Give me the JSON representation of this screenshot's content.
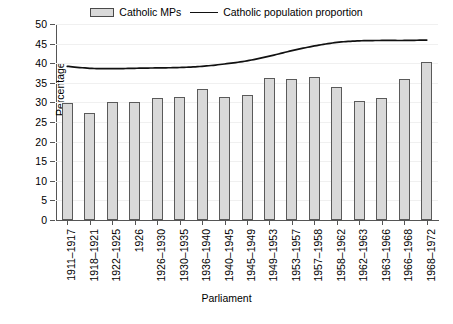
{
  "legend": {
    "items": [
      {
        "label": "Catholic MPs",
        "marker": "bar-swatch-icon",
        "color": "#d9d9d9"
      },
      {
        "label": "Catholic population proportion",
        "marker": "line-swatch-icon",
        "color": "#111111"
      }
    ]
  },
  "axes": {
    "ylabel": "Percentage",
    "xlabel": "Parliament",
    "yticks": [
      0,
      5,
      10,
      15,
      20,
      25,
      30,
      35,
      40,
      45,
      50
    ]
  },
  "chart_data": {
    "type": "bar",
    "title": "",
    "xlabel": "Parliament",
    "ylabel": "Percentage",
    "ylim": [
      0,
      50
    ],
    "grid": false,
    "legend_position": "top-center",
    "categories": [
      "1911–1917",
      "1918–1921",
      "1922–1925",
      "1926",
      "1926–1930",
      "1930–1935",
      "1936–1940",
      "1940–1945",
      "1945–1949",
      "1949–1953",
      "1953–1957",
      "1957–1958",
      "1958–1962",
      "1962–1963",
      "1963–1966",
      "1966–1968",
      "1968–1972"
    ],
    "series": [
      {
        "name": "Catholic MPs",
        "type": "bar",
        "color": "#d9d9d9",
        "edgecolor": "#5a5a5a",
        "values": [
          29.8,
          27.2,
          30.0,
          30.0,
          31.2,
          31.5,
          33.3,
          31.5,
          32.0,
          36.2,
          36.0,
          36.4,
          34.0,
          30.3,
          31.0,
          35.9,
          40.3
        ]
      },
      {
        "name": "Catholic population proportion",
        "type": "line",
        "color": "#111111",
        "values": [
          39.2,
          38.7,
          38.6,
          38.7,
          38.8,
          38.9,
          39.2,
          39.8,
          40.6,
          41.8,
          43.2,
          44.4,
          45.3,
          45.7,
          45.8,
          45.8,
          45.9
        ]
      }
    ]
  }
}
